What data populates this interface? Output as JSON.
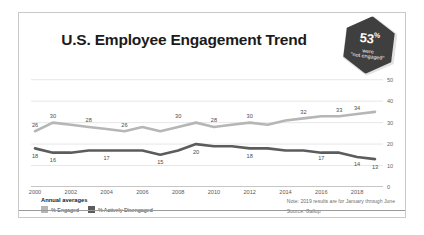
{
  "card": {
    "title": "U.S. Employee Engagement Trend"
  },
  "badge": {
    "number": "53",
    "percent": "%",
    "line1": "were",
    "line2": "\"not engaged\""
  },
  "legend": {
    "title": "Annual averages",
    "items": [
      {
        "label": "% Engaged",
        "color": "#b6b6b6"
      },
      {
        "label": "% Actively Disengaged",
        "color": "#5c5c5c"
      }
    ]
  },
  "notes": {
    "note": "Note: 2019 results are for January through June",
    "source": "Source: Gallup"
  },
  "chart_data": {
    "type": "line",
    "title": "U.S. Employee Engagement Trend",
    "xlabel": "",
    "ylabel": "",
    "ylim": [
      0,
      55
    ],
    "yticks": [
      0,
      10,
      20,
      30,
      40,
      50
    ],
    "grid": true,
    "legend_position": "bottom-left",
    "x": [
      2000,
      2001,
      2002,
      2003,
      2004,
      2005,
      2006,
      2007,
      2008,
      2009,
      2010,
      2011,
      2012,
      2013,
      2014,
      2015,
      2016,
      2017,
      2018,
      2019
    ],
    "xticks": [
      2000,
      2002,
      2004,
      2006,
      2008,
      2010,
      2012,
      2014,
      2016,
      2018
    ],
    "xticklabels": [
      "2000",
      "2002",
      "2004",
      "2006",
      "2008",
      "2010",
      "2012",
      "2014",
      "2016",
      "2018"
    ],
    "series": [
      {
        "name": "% Engaged",
        "color": "#b6b6b6",
        "values": [
          26,
          30,
          29,
          28,
          27,
          26,
          28,
          26,
          28,
          30,
          28,
          29,
          30,
          29,
          31,
          32,
          33,
          33,
          34,
          35
        ],
        "labels": [
          {
            "x": 2000,
            "y": 26,
            "text": "26"
          },
          {
            "x": 2001,
            "y": 30,
            "text": "30"
          },
          {
            "x": 2003,
            "y": 28,
            "text": "28"
          },
          {
            "x": 2005,
            "y": 26,
            "text": "26"
          },
          {
            "x": 2008,
            "y": 30,
            "text": "30"
          },
          {
            "x": 2010,
            "y": 28,
            "text": "28"
          },
          {
            "x": 2012,
            "y": 30,
            "text": "30"
          },
          {
            "x": 2015,
            "y": 32,
            "text": "32"
          },
          {
            "x": 2017,
            "y": 33,
            "text": "33"
          },
          {
            "x": 2018,
            "y": 34,
            "text": "34"
          }
        ]
      },
      {
        "name": "% Actively Disengaged",
        "color": "#5c5c5c",
        "values": [
          18,
          16,
          16,
          17,
          17,
          17,
          17,
          15,
          17,
          20,
          19,
          19,
          18,
          18,
          17,
          17,
          16,
          16,
          14,
          13
        ],
        "labels": [
          {
            "x": 2000,
            "y": 18,
            "text": "18"
          },
          {
            "x": 2001,
            "y": 16,
            "text": "16"
          },
          {
            "x": 2004,
            "y": 17,
            "text": "17"
          },
          {
            "x": 2007,
            "y": 15,
            "text": "15"
          },
          {
            "x": 2009,
            "y": 20,
            "text": "20"
          },
          {
            "x": 2012,
            "y": 18,
            "text": "18"
          },
          {
            "x": 2016,
            "y": 17,
            "text": "17"
          },
          {
            "x": 2018,
            "y": 14,
            "text": "14"
          },
          {
            "x": 2019,
            "y": 13,
            "text": "13"
          }
        ]
      }
    ]
  }
}
